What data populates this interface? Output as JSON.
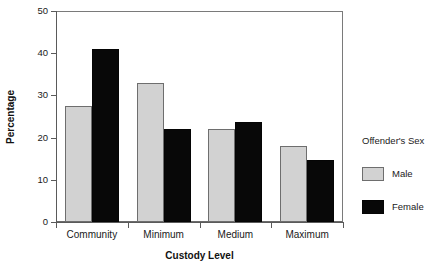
{
  "chart_data": {
    "type": "bar",
    "title": "",
    "xlabel": "Custody Level",
    "ylabel": "Percentage",
    "categories": [
      "Community",
      "Minimum",
      "Medium",
      "Maximum"
    ],
    "series": [
      {
        "name": "Male",
        "color": "#d2d2d2",
        "values": [
          27.4,
          33.0,
          22.1,
          18.1
        ]
      },
      {
        "name": "Female",
        "color": "#080808",
        "values": [
          41.1,
          22.0,
          23.6,
          14.6
        ]
      }
    ],
    "ylim": [
      0,
      50
    ],
    "yticks": [
      0,
      10,
      20,
      30,
      40,
      50
    ],
    "ytick_labels": [
      "0",
      "10",
      "20",
      "30",
      "40",
      "50"
    ],
    "grid": false,
    "legend": {
      "title": "Offender's Sex",
      "position": "right",
      "entries": [
        "Male",
        "Female"
      ]
    }
  },
  "axes": {
    "y_title": "Percentage",
    "x_title": "Custody Level"
  },
  "legend": {
    "title": "Offender's Sex",
    "items": [
      {
        "label": "Male",
        "swatch": "male-swatch"
      },
      {
        "label": "Female",
        "swatch": "female-swatch"
      }
    ]
  }
}
